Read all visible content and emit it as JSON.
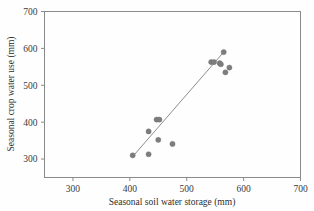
{
  "chart_data": {
    "type": "scatter",
    "title": "",
    "xlabel": "Seasonal soil water storage (mm)",
    "ylabel": "Seasonal crop water use (mm)",
    "xlim": [
      250,
      700
    ],
    "ylim": [
      250,
      700
    ],
    "xticks": [
      300,
      400,
      500,
      600,
      700
    ],
    "yticks": [
      300,
      400,
      500,
      600,
      700
    ],
    "xtick_labels": [
      "300",
      "400",
      "500",
      "600",
      "700"
    ],
    "ytick_labels": [
      "300",
      "400",
      "500",
      "600",
      "700"
    ],
    "grid": false,
    "legend": null,
    "marker": {
      "shape": "circle",
      "color": "#7d7d7d",
      "size": 4
    },
    "points": [
      {
        "x": 405,
        "y": 310
      },
      {
        "x": 433,
        "y": 313
      },
      {
        "x": 433,
        "y": 375
      },
      {
        "x": 447,
        "y": 407
      },
      {
        "x": 452,
        "y": 407
      },
      {
        "x": 450,
        "y": 352
      },
      {
        "x": 475,
        "y": 341
      },
      {
        "x": 543,
        "y": 563
      },
      {
        "x": 548,
        "y": 563
      },
      {
        "x": 558,
        "y": 560
      },
      {
        "x": 560,
        "y": 557
      },
      {
        "x": 565,
        "y": 590
      },
      {
        "x": 568,
        "y": 535
      },
      {
        "x": 575,
        "y": 548
      }
    ],
    "trendline": {
      "type": "linear",
      "color": "#8d8d8d",
      "x_start": 408,
      "y_start": 312,
      "x_end": 565,
      "y_end": 590
    }
  }
}
